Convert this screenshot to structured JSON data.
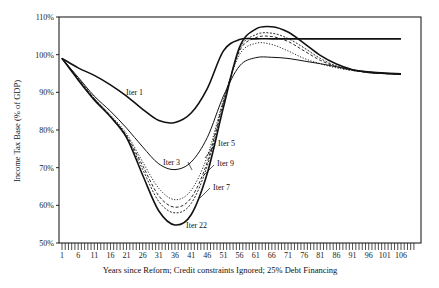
{
  "chart_data": {
    "type": "line",
    "title": "",
    "xlabel": "Years since Reform; Credit constraints Ignored; 25% Debt Financing",
    "ylabel": "Income Tax Base (% of GDP)",
    "ylim": [
      50,
      110
    ],
    "xlim": [
      1,
      110
    ],
    "yticks": [
      "50%",
      "60%",
      "70%",
      "80%",
      "90%",
      "100%",
      "110%"
    ],
    "ytick_values": [
      50,
      60,
      70,
      80,
      90,
      100,
      110
    ],
    "xticks": [
      "1",
      "6",
      "11",
      "16",
      "21",
      "26",
      "31",
      "36",
      "41",
      "46",
      "51",
      "56",
      "61",
      "66",
      "71",
      "76",
      "81",
      "86",
      "91",
      "96",
      "101",
      "106"
    ],
    "grid": false,
    "legend": "inline annotations",
    "x": [
      1,
      6,
      11,
      16,
      21,
      26,
      31,
      36,
      41,
      46,
      51,
      56,
      61,
      66,
      71,
      76,
      81,
      86,
      91,
      96,
      101,
      106
    ],
    "series": [
      {
        "name": "Iter 1",
        "style": "solid-thick",
        "values": [
          99,
          96.5,
          94.5,
          92,
          89,
          85.5,
          82.5,
          82,
          84.5,
          91,
          101,
          104,
          104.2,
          104.2,
          104.2,
          104.2,
          104.2,
          104.2,
          104.2,
          104.2,
          104.2,
          104.2
        ]
      },
      {
        "name": "Iter 3",
        "style": "solid-thin",
        "values": [
          99,
          94,
          89,
          85,
          80.5,
          75.5,
          71,
          69.5,
          71.5,
          78,
          89,
          97,
          99.2,
          99.3,
          99,
          98.3,
          97.6,
          96.8,
          96,
          95.5,
          95.2,
          95
        ]
      },
      {
        "name": "Iter 5",
        "style": "dotted",
        "values": [
          99,
          93.8,
          88.5,
          84,
          79,
          71.5,
          64.5,
          61.5,
          64,
          73,
          88,
          100,
          103,
          102.7,
          101,
          99,
          97.6,
          96.5,
          95.8,
          95.3,
          95.1,
          94.8
        ]
      },
      {
        "name": "Iter 7",
        "style": "dashed",
        "values": [
          99,
          93.6,
          88.3,
          83.7,
          78.5,
          70.5,
          62.5,
          59.5,
          62,
          71.5,
          87.5,
          101,
          104.5,
          104.8,
          103.5,
          101,
          98.5,
          96.8,
          95.8,
          95.3,
          95,
          94.8
        ]
      },
      {
        "name": "Iter 9",
        "style": "dashed-fine",
        "values": [
          99,
          93.5,
          88.2,
          83.6,
          78.2,
          69.5,
          61,
          58,
          60.5,
          70.5,
          87,
          101.5,
          105.3,
          105.7,
          104.3,
          101.8,
          99,
          97,
          95.9,
          95.3,
          95,
          94.8
        ]
      },
      {
        "name": "Iter 22",
        "style": "solid-thick",
        "values": [
          99,
          93.3,
          88,
          83.5,
          78,
          68,
          58.5,
          54.8,
          57.5,
          68.5,
          86,
          102,
          106.8,
          107.4,
          106,
          103,
          99.8,
          97.5,
          96,
          95.3,
          95,
          94.8
        ]
      }
    ],
    "annotations": [
      {
        "text": "Iter 1",
        "x": 22,
        "y": 92
      },
      {
        "text": "Iter 3",
        "x": 31,
        "y": 72
      },
      {
        "text": "Iter 5",
        "x": 51,
        "y": 75
      },
      {
        "text": "Iter 9",
        "x": 51,
        "y": 71
      },
      {
        "text": "Iter 7",
        "x": 48,
        "y": 66
      },
      {
        "text": "Iter 22",
        "x": 41,
        "y": 54
      }
    ]
  }
}
